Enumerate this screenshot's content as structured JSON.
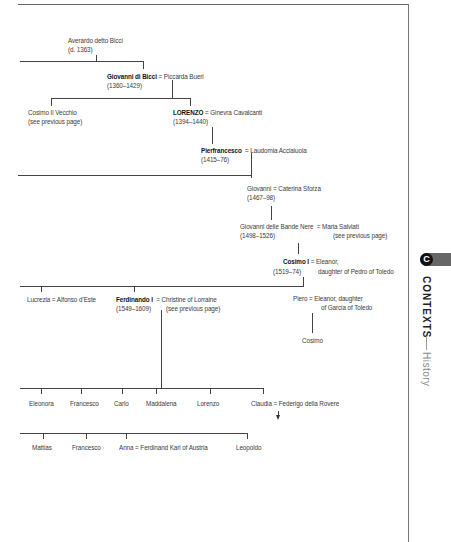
{
  "page": {
    "section_badge": "C",
    "section_label": "CONTEXTS",
    "subsection_label": "History"
  },
  "tree": {
    "averardo": {
      "name": "Averardo detto Bicci",
      "dates": "(d. 1363)"
    },
    "giovanni_bicci": {
      "name": "Giovanni di Bicci",
      "spouse": "= Piccarda Bueri",
      "dates": "(1360–1429)"
    },
    "cosimo_vecchio": {
      "name": "Cosimo Il Vecchio",
      "note": "(see previous page)"
    },
    "lorenzo": {
      "name": "LORENZO",
      "spouse": "= Ginevra Cavalcanti",
      "dates": "(1394–1440)"
    },
    "pierfrancesco": {
      "name": "Pierfrancesco",
      "spouse": "= Laudomia Acciaiuola",
      "dates": "(1415–76)"
    },
    "giovanni": {
      "name": "Giovanni",
      "spouse": "= Caterina Sforza",
      "dates": "(1467–98)"
    },
    "giovanni_bande_nere": {
      "name": "Giovanni delle Bande Nere",
      "spouse": "= Maria Salviati",
      "dates": "(1498–1526)",
      "note": "(see previous page)"
    },
    "cosimo_i": {
      "name": "Cosimo I",
      "spouse": "= Eleanor,",
      "dates": "(1519–74)",
      "spouse_line2": "daughter of Pedro of Toledo"
    },
    "lucrezia": {
      "name": "Lucrezia = Alfonso d’Este"
    },
    "ferdinando_i": {
      "name": "Ferdinando I",
      "spouse": "= Christine of Lorraine",
      "dates": "(1549–1609)",
      "note": "(see previous page)"
    },
    "piero": {
      "name": "Piero",
      "spouse": "= Eleanor, daughter",
      "spouse_line2": "of Garcia of Toledo"
    },
    "cosimo": {
      "name": "Cosimo"
    },
    "children_ferdinando": [
      "Eleonora",
      "Francesco",
      "Carlo",
      "Maddalena",
      "Lorenzo",
      "Claudia = Federigo della Rovere"
    ],
    "grandchildren": [
      "Mattias",
      "Francesco",
      "Anna = Ferdinand Karl of Austria",
      "Leopoldo"
    ]
  }
}
